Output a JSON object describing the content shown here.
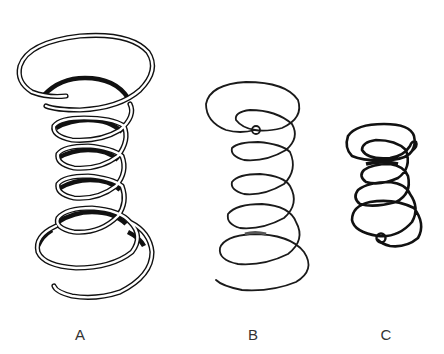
{
  "figure": {
    "springs": [
      {
        "id": "A",
        "label": "A",
        "style": "double-line heavy wire, conical ends, flared top and bottom coils"
      },
      {
        "id": "B",
        "label": "B",
        "style": "thin single-line wire, loop end at top, flared bottom coil"
      },
      {
        "id": "C",
        "label": "C",
        "style": "short heavy single-line wire, hourglass form, hooked loop ends"
      }
    ]
  },
  "labels": {
    "a": "A",
    "b": "B",
    "c": "C"
  }
}
